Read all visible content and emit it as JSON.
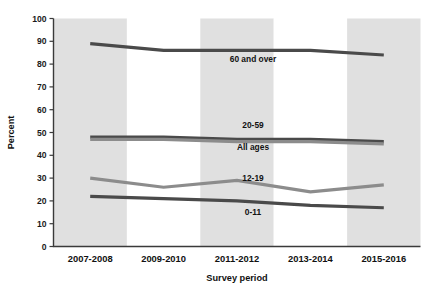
{
  "chart_data": {
    "type": "line",
    "title": "",
    "xlabel": "Survey period",
    "ylabel": "Percent",
    "categories": [
      "2007-2008",
      "2009-2010",
      "2011-2012",
      "2013-2014",
      "2015-2016"
    ],
    "ylim": [
      0,
      100
    ],
    "yticks": [
      0,
      10,
      20,
      30,
      40,
      50,
      60,
      70,
      80,
      90,
      100
    ],
    "grid": false,
    "legend_position": "inline-labels",
    "banded_background": true,
    "series": [
      {
        "name": "60 and over",
        "values": [
          89,
          86,
          86,
          86,
          84
        ],
        "color": "#4a4a4a",
        "label_x": 253,
        "label_y": 62
      },
      {
        "name": "20-59",
        "values": [
          48,
          48,
          47,
          47,
          46
        ],
        "color": "#4a4a4a",
        "label_x": 253,
        "label_y": 128
      },
      {
        "name": "All ages",
        "values": [
          47,
          47,
          46,
          46,
          45
        ],
        "color": "#8c8c8c",
        "label_x": 253,
        "label_y": 150
      },
      {
        "name": "12-19",
        "values": [
          30,
          26,
          29,
          24,
          27
        ],
        "color": "#8c8c8c",
        "label_x": 253,
        "label_y": 181
      },
      {
        "name": "0-11",
        "values": [
          22,
          21,
          20,
          18,
          17
        ],
        "color": "#4a4a4a",
        "label_x": 253,
        "label_y": 215
      }
    ]
  },
  "axis": {
    "y_title": "Percent",
    "x_title": "Survey period",
    "y_tick_labels": [
      "100",
      "90",
      "80",
      "70",
      "60",
      "50",
      "40",
      "30",
      "20",
      "10",
      "0"
    ]
  },
  "colors": {
    "band_shaded": "#e0e0e0",
    "band_plain": "#ffffff",
    "axis": "#3a3a3a",
    "text": "#111111",
    "series_dark": "#4a4a4a",
    "series_light": "#8c8c8c"
  }
}
